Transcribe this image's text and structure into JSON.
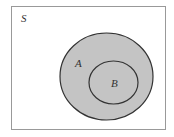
{
  "diagram": {
    "type": "venn",
    "universe": {
      "label": "S"
    },
    "sets": [
      {
        "label": "A",
        "fill": "#c4c4c4"
      },
      {
        "label": "B",
        "fill": "#c4c4c4"
      }
    ],
    "relationship": "B is a subset of A",
    "colors": {
      "stroke": "#333333",
      "border": "#999999",
      "background": "#ffffff",
      "shade": "#c4c4c4"
    }
  }
}
